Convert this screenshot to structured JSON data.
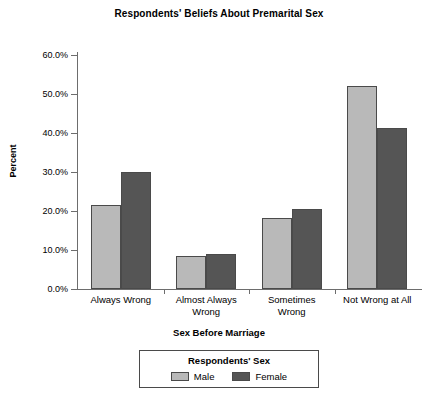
{
  "chart_data": {
    "type": "bar",
    "title": "Respondents' Beliefs About Premarital Sex",
    "xlabel": "Sex Before Marriage",
    "ylabel": "Percent",
    "categories": [
      "Always Wrong",
      "Almost Always Wrong",
      "Sometimes Wrong",
      "Not Wrong at All"
    ],
    "category_lines": [
      [
        "Always Wrong"
      ],
      [
        "Almost Always",
        "Wrong"
      ],
      [
        "Sometimes",
        "Wrong"
      ],
      [
        "Not Wrong at All"
      ]
    ],
    "series": [
      {
        "name": "Male",
        "color": "#b9b9b9",
        "values": [
          21.5,
          8.5,
          18.2,
          52.0
        ]
      },
      {
        "name": "Female",
        "color": "#555555",
        "values": [
          30.0,
          9.0,
          20.5,
          41.2
        ]
      }
    ],
    "ylim": [
      0,
      60
    ],
    "ytick_values": [
      0,
      10,
      20,
      30,
      40,
      50,
      60
    ],
    "ytick_labels": [
      "0.0%",
      "10.0%",
      "20.0%",
      "30.0%",
      "40.0%",
      "50.0%",
      "60.0%"
    ],
    "grid": false,
    "legend_position": "bottom-outside",
    "legend_title": "Respondents' Sex"
  }
}
